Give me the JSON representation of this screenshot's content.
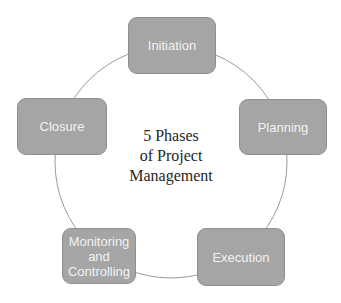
{
  "diagram": {
    "type": "cycle",
    "title_lines": [
      "5 Phases",
      "of Project",
      "Management"
    ],
    "phases": [
      {
        "label": "Initiation"
      },
      {
        "label": "Planning"
      },
      {
        "label": "Execution"
      },
      {
        "label": "Monitoring and Controlling",
        "lines": [
          "Monitoring",
          "and",
          "Controlling"
        ]
      },
      {
        "label": "Closure"
      }
    ],
    "colors": {
      "box_fill": "#a5a5a5",
      "box_border": "#8f8f8f",
      "box_text": "#f2f2f2",
      "ring": "#9a9a9a",
      "center_text": "#262626"
    }
  }
}
